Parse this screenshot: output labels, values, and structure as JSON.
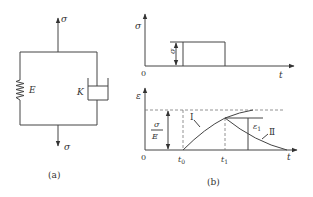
{
  "figure_a": {
    "caption": "(a)",
    "stress_top_label": "σ",
    "stress_bottom_label": "σ",
    "spring_label": "E",
    "dashpot_label": "K"
  },
  "figure_b": {
    "caption": "(b)",
    "top_graph": {
      "y_axis_label": "σ",
      "x_axis_label": "t",
      "origin_label": "0",
      "amplitude_label": "σ"
    },
    "bottom_graph": {
      "y_axis_label": "ε",
      "x_axis_label": "t",
      "origin_label": "0",
      "t0_label": "t",
      "t0_subscript": "0",
      "t1_label": "t",
      "t1_subscript": "1",
      "ratio_numerator": "σ",
      "ratio_denominator": "E",
      "curve1_label": "Ⅰ",
      "curve2_label": "Ⅱ",
      "eps1_label": "ε",
      "eps1_subscript": "1"
    }
  }
}
